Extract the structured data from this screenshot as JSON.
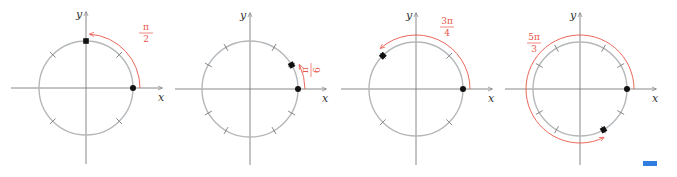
{
  "colors": {
    "axis": "#7a7a7a",
    "circle": "#b5b8bb",
    "angle_arc": "#e8564a",
    "point": "#111111",
    "blue_marker": "#2f7de1"
  },
  "axis_labels": {
    "x": "x",
    "y": "y"
  },
  "diagrams": [
    {
      "name": "angle-pi-over-2",
      "cx": 86,
      "cy": 88,
      "r": 47,
      "ticks_deg": [
        45,
        135,
        225,
        315
      ],
      "angle_deg": 90,
      "arc_radius": 54,
      "direction": "counterclockwise",
      "label": {
        "numerator": "π",
        "denominator": "2",
        "x": 146,
        "y": 30
      }
    },
    {
      "name": "angle-pi-over-6",
      "cx": 250,
      "cy": 89,
      "r": 48,
      "ticks_deg": [
        30,
        60,
        120,
        150,
        210,
        240,
        300,
        330
      ],
      "angle_deg": 30,
      "arc_radius": 55,
      "direction": "counterclockwise",
      "label": {
        "numerator": "π",
        "denominator": "6",
        "x": 312,
        "y": 66
      }
    },
    {
      "name": "angle-3pi-over-4",
      "cx": 416,
      "cy": 89,
      "r": 47,
      "ticks_deg": [
        45,
        135,
        225,
        315
      ],
      "angle_deg": 135,
      "arc_radius": 54,
      "direction": "counterclockwise",
      "label": {
        "numerator": "3π",
        "denominator": "4",
        "x": 447,
        "y": 24
      }
    },
    {
      "name": "angle-5pi-over-3",
      "cx": 580,
      "cy": 89,
      "r": 47,
      "ticks_deg": [
        30,
        60,
        120,
        150,
        210,
        240,
        300,
        330
      ],
      "angle_deg": 300,
      "arc_radius": 54,
      "direction": "counterclockwise",
      "label": {
        "numerator": "5π",
        "denominator": "3",
        "x": 534,
        "y": 40
      }
    }
  ],
  "extra": {
    "blue_marker": "progress-indicator"
  }
}
